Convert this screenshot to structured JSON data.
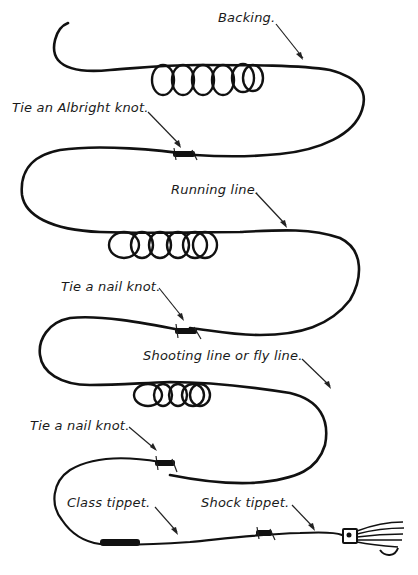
{
  "diagram": {
    "labels": {
      "backing": "Backing.",
      "albright": "Tie an Albright knot.",
      "running_line": "Running line.",
      "nail_knot_1": "Tie a nail knot.",
      "shooting_line": "Shooting line or fly line.",
      "nail_knot_2": "Tie a nail knot.",
      "class_tippet": "Class tippet.",
      "shock_tippet": "Shock tippet."
    },
    "segments": [
      {
        "name": "Backing",
        "coils": 6
      },
      {
        "name": "Running line",
        "coils": 5
      },
      {
        "name": "Shooting line or fly line",
        "coils": 4
      },
      {
        "name": "Class tippet",
        "coils": 0
      },
      {
        "name": "Shock tippet",
        "coils": 0
      }
    ],
    "knots": [
      "Albright knot",
      "Nail knot",
      "Nail knot"
    ],
    "terminal": "fly",
    "colors": {
      "ink": "#111111",
      "background": "#ffffff"
    }
  }
}
